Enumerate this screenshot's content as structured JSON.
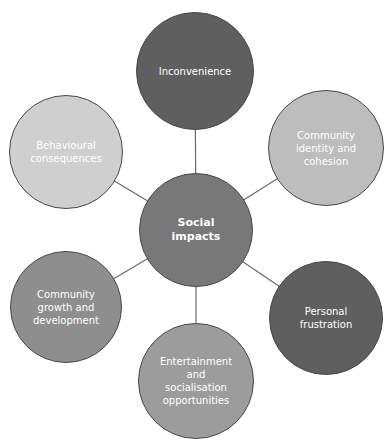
{
  "diagram": {
    "hub": {
      "label": "Social\nimpacts",
      "color": "#787878",
      "cx": 196,
      "cy": 230,
      "r": 57
    },
    "nodes": [
      {
        "id": "inconvenience",
        "label": "Inconvenience",
        "color": "#5f5f5f",
        "cx": 195,
        "cy": 71,
        "r": 59
      },
      {
        "id": "community-identity",
        "label": "Community\nidentity and\ncohesion",
        "color": "#bdbdbd",
        "cx": 326,
        "cy": 148,
        "r": 58
      },
      {
        "id": "personal-frustration",
        "label": "Personal\nfrustration",
        "color": "#5f5f5f",
        "cx": 326,
        "cy": 318,
        "r": 57
      },
      {
        "id": "entertainment",
        "label": "Entertainment\nand\nsocialisation\nopportunities",
        "color": "#9c9c9c",
        "cx": 196,
        "cy": 381,
        "r": 58
      },
      {
        "id": "community-growth",
        "label": "Community\ngrowth and\ndevelopment",
        "color": "#8e8e8e",
        "cx": 66,
        "cy": 307,
        "r": 56
      },
      {
        "id": "behavioural",
        "label": "Behavioural\nconsequences",
        "color": "#cfcfcf",
        "cx": 66,
        "cy": 152,
        "r": 57
      }
    ],
    "line_color": "#6a6a6a"
  }
}
